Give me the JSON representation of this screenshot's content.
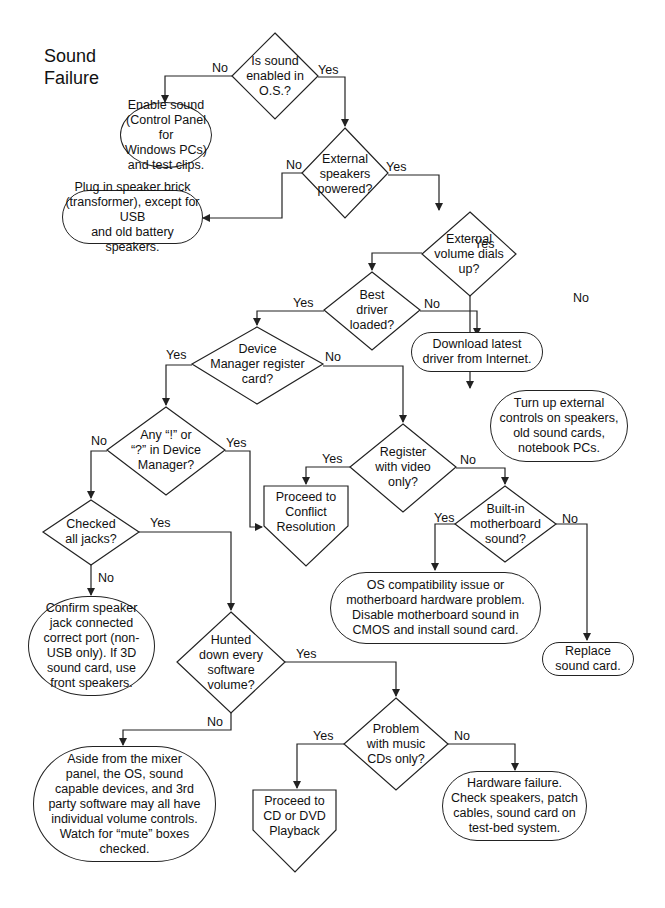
{
  "title": "Sound\nFailure",
  "decisions": [
    {
      "id": "d1",
      "text": "Is sound\nenabled in\nO.S.?"
    },
    {
      "id": "d2",
      "text": "External\nspeakers\npowered?"
    },
    {
      "id": "d3",
      "text": "External\nvolume dials\nup?"
    },
    {
      "id": "d4",
      "text": "Best\ndriver\nloaded?"
    },
    {
      "id": "d5",
      "text": "Device\nManager register\ncard?"
    },
    {
      "id": "d6",
      "text": "Any “!” or\n“?” in Device\nManager?"
    },
    {
      "id": "d7",
      "text": "Register\nwith video\nonly?"
    },
    {
      "id": "d8",
      "text": "Built-in\nmotherboard\nsound?"
    },
    {
      "id": "d9",
      "text": "Checked\nall jacks?"
    },
    {
      "id": "d10",
      "text": "Hunted\ndown every\nsoftware\nvolume?"
    },
    {
      "id": "d11",
      "text": "Problem\nwith music\nCDs only?"
    }
  ],
  "terminals": [
    {
      "id": "t1",
      "text": "Enable sound\n(Control Panel for\nWindows PCs)\nand test clips."
    },
    {
      "id": "t2",
      "text": "Plug in speaker brick\n(transformer), except for USB\nand old battery speakers."
    },
    {
      "id": "t3",
      "text": "Download latest\ndriver from Internet."
    },
    {
      "id": "t4",
      "text": "Turn up external\ncontrols on speakers,\nold sound cards,\nnotebook PCs."
    },
    {
      "id": "t5",
      "text": "OS compatibility issue or\nmotherboard hardware problem.\nDisable motherboard sound in\nCMOS  and install sound card."
    },
    {
      "id": "t6",
      "text": "Replace\nsound card."
    },
    {
      "id": "t7",
      "text": "Confirm speaker\njack connected\ncorrect port (non-\nUSB only). If 3D\nsound card, use\nfront speakers."
    },
    {
      "id": "t8",
      "text": "Aside from the mixer\npanel, the OS, sound\ncapable devices, and 3rd\nparty software may all have\nindividual volume controls.\nWatch for “mute” boxes\nchecked."
    },
    {
      "id": "t9",
      "text": "Hardware failure.\nCheck speakers, patch\ncables, sound card on\ntest-bed system."
    }
  ],
  "offpage": [
    {
      "id": "o1",
      "text": "Proceed to\nConflict\nResolution"
    },
    {
      "id": "o2",
      "text": "Proceed to\nCD or DVD\nPlayback"
    }
  ],
  "labels": {
    "yes": "Yes",
    "no": "No"
  },
  "colors": {
    "line": "#222222",
    "background": "#ffffff"
  }
}
